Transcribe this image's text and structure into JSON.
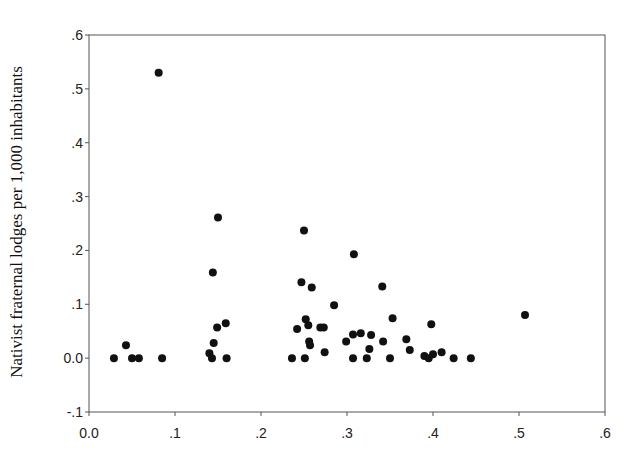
{
  "chart_data": {
    "type": "scatter",
    "title": "",
    "xlabel": "",
    "ylabel": "Nativist fraternal lodges per 1,000 inhabitants",
    "xlim": [
      0.0,
      0.6
    ],
    "ylim": [
      -0.1,
      0.6
    ],
    "x_ticks": [
      0.0,
      0.1,
      0.2,
      0.3,
      0.4,
      0.5,
      0.6
    ],
    "x_tick_labels": [
      "0.0",
      ".1",
      ".2",
      ".3",
      ".4",
      ".5",
      ".6"
    ],
    "y_ticks": [
      -0.1,
      0.0,
      0.1,
      0.2,
      0.3,
      0.4,
      0.5,
      0.6
    ],
    "y_tick_labels": [
      "-.1",
      "0.0",
      ".1",
      ".2",
      ".3",
      ".4",
      ".5",
      ".6"
    ],
    "grid": false,
    "legend": null,
    "marker_color": "#111111",
    "points": [
      [
        0.029,
        0.0
      ],
      [
        0.043,
        0.024
      ],
      [
        0.05,
        0.0
      ],
      [
        0.058,
        0.0
      ],
      [
        0.081,
        0.53
      ],
      [
        0.085,
        0.0
      ],
      [
        0.15,
        0.261
      ],
      [
        0.144,
        0.159
      ],
      [
        0.159,
        0.065
      ],
      [
        0.149,
        0.057
      ],
      [
        0.145,
        0.028
      ],
      [
        0.14,
        0.009
      ],
      [
        0.143,
        0.0
      ],
      [
        0.16,
        0.0
      ],
      [
        0.25,
        0.237
      ],
      [
        0.247,
        0.141
      ],
      [
        0.259,
        0.131
      ],
      [
        0.252,
        0.072
      ],
      [
        0.255,
        0.061
      ],
      [
        0.242,
        0.054
      ],
      [
        0.269,
        0.057
      ],
      [
        0.273,
        0.057
      ],
      [
        0.256,
        0.031
      ],
      [
        0.257,
        0.024
      ],
      [
        0.236,
        0.0
      ],
      [
        0.251,
        0.0
      ],
      [
        0.274,
        0.011
      ],
      [
        0.308,
        0.193
      ],
      [
        0.285,
        0.098
      ],
      [
        0.299,
        0.031
      ],
      [
        0.307,
        0.044
      ],
      [
        0.316,
        0.046
      ],
      [
        0.328,
        0.043
      ],
      [
        0.342,
        0.031
      ],
      [
        0.326,
        0.017
      ],
      [
        0.307,
        0.0
      ],
      [
        0.323,
        0.0
      ],
      [
        0.341,
        0.133
      ],
      [
        0.353,
        0.074
      ],
      [
        0.369,
        0.035
      ],
      [
        0.373,
        0.015
      ],
      [
        0.35,
        0.0
      ],
      [
        0.398,
        0.063
      ],
      [
        0.39,
        0.004
      ],
      [
        0.395,
        0.0
      ],
      [
        0.4,
        0.007
      ],
      [
        0.41,
        0.011
      ],
      [
        0.424,
        0.0
      ],
      [
        0.444,
        0.0
      ],
      [
        0.507,
        0.08
      ]
    ]
  }
}
